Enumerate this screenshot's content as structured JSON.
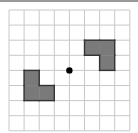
{
  "diagram": {
    "type": "grid-rotation-figure",
    "grid": {
      "columns": 8,
      "rows": 8,
      "origin_x": 9,
      "origin_y": 10,
      "cell_size": 15.1,
      "line_color": "#c8c8c8"
    },
    "center_point": {
      "col": 4,
      "row": 4,
      "color": "#000000"
    },
    "shapes": [
      {
        "name": "left-l-shape",
        "fill": "#7a7a7a",
        "stroke": "#333333",
        "cells": [
          [
            1,
            4
          ],
          [
            1,
            5
          ],
          [
            2,
            5
          ]
        ]
      },
      {
        "name": "right-l-shape",
        "fill": "#7a7a7a",
        "stroke": "#333333",
        "cells": [
          [
            5,
            2
          ],
          [
            6,
            2
          ],
          [
            6,
            3
          ]
        ]
      }
    ]
  }
}
